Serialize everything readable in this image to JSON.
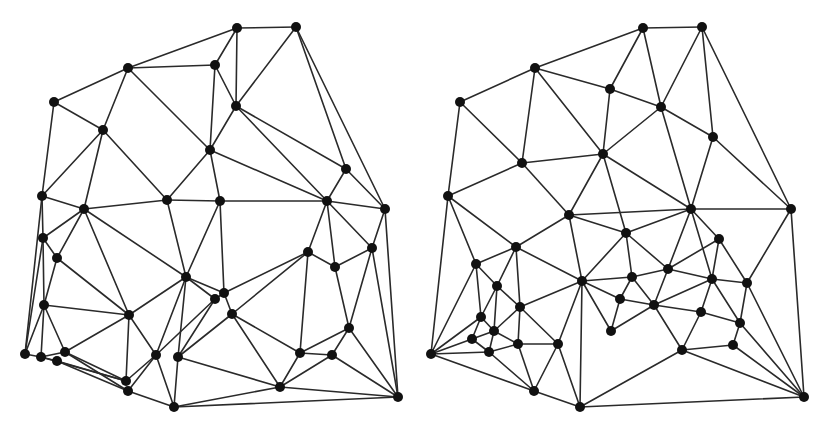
{
  "colors": {
    "background": "#ffffff",
    "edge": "#2a2a2a",
    "node": "#111111"
  },
  "node_radius": 5,
  "graphs": [
    {
      "name": "left-triangulation",
      "nodes": [
        [
          237,
          28
        ],
        [
          296,
          27
        ],
        [
          128,
          68
        ],
        [
          215,
          65
        ],
        [
          54,
          102
        ],
        [
          236,
          106
        ],
        [
          103,
          130
        ],
        [
          210,
          150
        ],
        [
          346,
          169
        ],
        [
          42,
          196
        ],
        [
          84,
          209
        ],
        [
          167,
          200
        ],
        [
          220,
          201
        ],
        [
          327,
          201
        ],
        [
          385,
          209
        ],
        [
          43,
          238
        ],
        [
          57,
          258
        ],
        [
          308,
          252
        ],
        [
          335,
          267
        ],
        [
          372,
          248
        ],
        [
          186,
          277
        ],
        [
          224,
          293
        ],
        [
          215,
          299
        ],
        [
          232,
          314
        ],
        [
          44,
          305
        ],
        [
          129,
          315
        ],
        [
          349,
          328
        ],
        [
          25,
          354
        ],
        [
          41,
          357
        ],
        [
          57,
          361
        ],
        [
          65,
          352
        ],
        [
          300,
          353
        ],
        [
          332,
          355
        ],
        [
          156,
          355
        ],
        [
          178,
          357
        ],
        [
          126,
          381
        ],
        [
          128,
          391
        ],
        [
          280,
          387
        ],
        [
          174,
          407
        ],
        [
          398,
          397
        ]
      ],
      "edges": [
        [
          0,
          1
        ],
        [
          0,
          2
        ],
        [
          0,
          3
        ],
        [
          0,
          5
        ],
        [
          1,
          5
        ],
        [
          1,
          8
        ],
        [
          1,
          14
        ],
        [
          2,
          3
        ],
        [
          2,
          4
        ],
        [
          2,
          6
        ],
        [
          2,
          7
        ],
        [
          3,
          5
        ],
        [
          3,
          7
        ],
        [
          4,
          6
        ],
        [
          4,
          9
        ],
        [
          5,
          7
        ],
        [
          5,
          8
        ],
        [
          5,
          13
        ],
        [
          6,
          9
        ],
        [
          6,
          10
        ],
        [
          6,
          11
        ],
        [
          7,
          11
        ],
        [
          7,
          12
        ],
        [
          7,
          13
        ],
        [
          8,
          13
        ],
        [
          8,
          14
        ],
        [
          9,
          10
        ],
        [
          9,
          15
        ],
        [
          9,
          27
        ],
        [
          10,
          11
        ],
        [
          10,
          15
        ],
        [
          10,
          16
        ],
        [
          10,
          20
        ],
        [
          10,
          25
        ],
        [
          11,
          12
        ],
        [
          11,
          20
        ],
        [
          12,
          13
        ],
        [
          12,
          20
        ],
        [
          12,
          21
        ],
        [
          13,
          14
        ],
        [
          13,
          17
        ],
        [
          13,
          19
        ],
        [
          13,
          18
        ],
        [
          14,
          19
        ],
        [
          14,
          39
        ],
        [
          15,
          16
        ],
        [
          15,
          24
        ],
        [
          15,
          27
        ],
        [
          16,
          25
        ],
        [
          16,
          24
        ],
        [
          17,
          18
        ],
        [
          17,
          23
        ],
        [
          17,
          31
        ],
        [
          17,
          21
        ],
        [
          18,
          19
        ],
        [
          18,
          26
        ],
        [
          19,
          26
        ],
        [
          19,
          39
        ],
        [
          20,
          22
        ],
        [
          20,
          25
        ],
        [
          20,
          33
        ],
        [
          20,
          34
        ],
        [
          20,
          21
        ],
        [
          21,
          22
        ],
        [
          21,
          23
        ],
        [
          22,
          33
        ],
        [
          22,
          34
        ],
        [
          23,
          34
        ],
        [
          23,
          31
        ],
        [
          23,
          37
        ],
        [
          24,
          25
        ],
        [
          24,
          27
        ],
        [
          24,
          28
        ],
        [
          24,
          30
        ],
        [
          25,
          30
        ],
        [
          25,
          33
        ],
        [
          25,
          35
        ],
        [
          26,
          31
        ],
        [
          26,
          32
        ],
        [
          26,
          39
        ],
        [
          27,
          28
        ],
        [
          28,
          29
        ],
        [
          28,
          30
        ],
        [
          28,
          35
        ],
        [
          29,
          36
        ],
        [
          29,
          35
        ],
        [
          30,
          35
        ],
        [
          30,
          36
        ],
        [
          31,
          32
        ],
        [
          31,
          37
        ],
        [
          32,
          37
        ],
        [
          32,
          39
        ],
        [
          33,
          35
        ],
        [
          33,
          36
        ],
        [
          33,
          38
        ],
        [
          34,
          38
        ],
        [
          34,
          37
        ],
        [
          36,
          38
        ],
        [
          37,
          38
        ],
        [
          37,
          39
        ],
        [
          38,
          39
        ]
      ]
    },
    {
      "name": "right-triangulation",
      "nodes": [
        [
          643,
          28
        ],
        [
          702,
          27
        ],
        [
          535,
          68
        ],
        [
          610,
          89
        ],
        [
          460,
          102
        ],
        [
          661,
          107
        ],
        [
          713,
          137
        ],
        [
          603,
          154
        ],
        [
          522,
          163
        ],
        [
          448,
          196
        ],
        [
          569,
          215
        ],
        [
          691,
          209
        ],
        [
          791,
          209
        ],
        [
          626,
          233
        ],
        [
          516,
          247
        ],
        [
          719,
          239
        ],
        [
          476,
          264
        ],
        [
          497,
          286
        ],
        [
          582,
          281
        ],
        [
          632,
          277
        ],
        [
          668,
          269
        ],
        [
          712,
          279
        ],
        [
          747,
          283
        ],
        [
          620,
          299
        ],
        [
          520,
          307
        ],
        [
          654,
          305
        ],
        [
          701,
          312
        ],
        [
          481,
          317
        ],
        [
          740,
          323
        ],
        [
          494,
          331
        ],
        [
          611,
          331
        ],
        [
          472,
          339
        ],
        [
          518,
          344
        ],
        [
          558,
          344
        ],
        [
          489,
          352
        ],
        [
          682,
          350
        ],
        [
          733,
          345
        ],
        [
          431,
          354
        ],
        [
          534,
          391
        ],
        [
          580,
          407
        ],
        [
          804,
          397
        ]
      ],
      "edges": [
        [
          0,
          1
        ],
        [
          0,
          2
        ],
        [
          0,
          3
        ],
        [
          0,
          5
        ],
        [
          1,
          5
        ],
        [
          1,
          6
        ],
        [
          1,
          12
        ],
        [
          2,
          3
        ],
        [
          2,
          4
        ],
        [
          2,
          7
        ],
        [
          2,
          8
        ],
        [
          3,
          5
        ],
        [
          3,
          7
        ],
        [
          4,
          8
        ],
        [
          4,
          9
        ],
        [
          5,
          6
        ],
        [
          5,
          7
        ],
        [
          5,
          11
        ],
        [
          6,
          11
        ],
        [
          6,
          12
        ],
        [
          7,
          8
        ],
        [
          7,
          10
        ],
        [
          7,
          13
        ],
        [
          7,
          11
        ],
        [
          8,
          9
        ],
        [
          8,
          10
        ],
        [
          9,
          14
        ],
        [
          9,
          16
        ],
        [
          9,
          37
        ],
        [
          10,
          11
        ],
        [
          10,
          13
        ],
        [
          10,
          14
        ],
        [
          10,
          18
        ],
        [
          11,
          12
        ],
        [
          11,
          13
        ],
        [
          11,
          15
        ],
        [
          11,
          20
        ],
        [
          11,
          21
        ],
        [
          12,
          22
        ],
        [
          12,
          40
        ],
        [
          13,
          18
        ],
        [
          13,
          19
        ],
        [
          13,
          20
        ],
        [
          14,
          16
        ],
        [
          14,
          17
        ],
        [
          14,
          24
        ],
        [
          14,
          18
        ],
        [
          15,
          20
        ],
        [
          15,
          21
        ],
        [
          15,
          22
        ],
        [
          16,
          17
        ],
        [
          16,
          27
        ],
        [
          16,
          37
        ],
        [
          17,
          24
        ],
        [
          17,
          27
        ],
        [
          17,
          29
        ],
        [
          18,
          19
        ],
        [
          18,
          23
        ],
        [
          18,
          24
        ],
        [
          18,
          30
        ],
        [
          18,
          33
        ],
        [
          18,
          39
        ],
        [
          19,
          20
        ],
        [
          19,
          23
        ],
        [
          19,
          25
        ],
        [
          20,
          25
        ],
        [
          20,
          21
        ],
        [
          21,
          22
        ],
        [
          21,
          25
        ],
        [
          21,
          26
        ],
        [
          21,
          28
        ],
        [
          22,
          28
        ],
        [
          22,
          40
        ],
        [
          23,
          25
        ],
        [
          23,
          30
        ],
        [
          24,
          29
        ],
        [
          24,
          32
        ],
        [
          24,
          33
        ],
        [
          25,
          26
        ],
        [
          25,
          30
        ],
        [
          25,
          35
        ],
        [
          26,
          28
        ],
        [
          26,
          35
        ],
        [
          27,
          29
        ],
        [
          27,
          31
        ],
        [
          27,
          37
        ],
        [
          28,
          36
        ],
        [
          28,
          40
        ],
        [
          29,
          31
        ],
        [
          29,
          32
        ],
        [
          29,
          34
        ],
        [
          31,
          34
        ],
        [
          31,
          37
        ],
        [
          32,
          33
        ],
        [
          32,
          34
        ],
        [
          32,
          38
        ],
        [
          33,
          38
        ],
        [
          33,
          39
        ],
        [
          34,
          37
        ],
        [
          34,
          38
        ],
        [
          35,
          36
        ],
        [
          35,
          39
        ],
        [
          35,
          40
        ],
        [
          36,
          40
        ],
        [
          37,
          38
        ],
        [
          38,
          39
        ],
        [
          39,
          40
        ]
      ]
    }
  ]
}
